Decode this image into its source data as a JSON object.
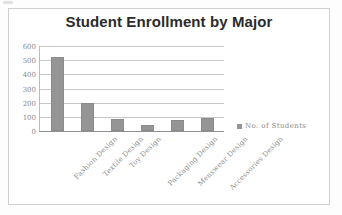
{
  "frame": {
    "border_color": "#cfcfcf",
    "background": "#ffffff"
  },
  "chart_data": {
    "type": "bar",
    "title": "Student Enrollment by Major",
    "xlabel": "",
    "ylabel": "",
    "categories": [
      "Fashion Design",
      "Textile Design",
      "Toy Design",
      "Packaging Design",
      "Menswear Design",
      "Accessories Design"
    ],
    "series": [
      {
        "name": "No. of Students",
        "values": [
          520,
          200,
          85,
          40,
          80,
          90
        ],
        "color": "#959595"
      }
    ],
    "ylim": [
      0,
      600
    ],
    "yticks": [
      600,
      500,
      400,
      300,
      200,
      100,
      0
    ],
    "ytick_labels": [
      "600",
      "500",
      "400",
      "300",
      "200",
      "100",
      "0"
    ],
    "grid": true,
    "grid_color": "#c8c8c8",
    "legend": {
      "position": "right",
      "entries": [
        {
          "label": "No. of Students",
          "color": "#959595"
        }
      ]
    }
  }
}
